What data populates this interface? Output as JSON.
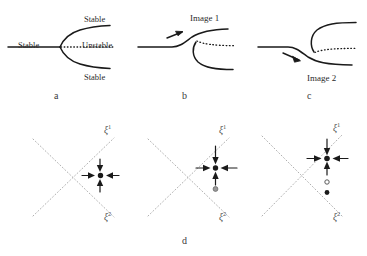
{
  "figure": {
    "type": "bifurcation-diagram-and-phase-portraits",
    "width": 367,
    "height": 256,
    "background": "#ffffff",
    "stroke_color": "#1a1a1a",
    "dotted_axis_color": "#b0b0b0",
    "open_circle_color": "#8a8a8a"
  },
  "panel_a": {
    "letter": "a",
    "labels": {
      "left_stable": "Stable",
      "upper_stable": "Stable",
      "unstable": "Unstable",
      "lower_stable": "Stable"
    }
  },
  "panel_b": {
    "letter": "b",
    "labels": {
      "image": "Image 1"
    }
  },
  "panel_c": {
    "letter": "c",
    "labels": {
      "image": "Image 2"
    }
  },
  "panel_d": {
    "letter": "d",
    "portraits": [
      {
        "name": "portrait-left",
        "axis_labels": {
          "axis1": "ξ",
          "axis1_sup": "1",
          "axis2": "ξ",
          "axis2_sup": "2"
        },
        "equilibria": [
          {
            "kind": "filled-node",
            "arrows": 4
          }
        ]
      },
      {
        "name": "portrait-middle",
        "axis_labels": {
          "axis1": "ξ",
          "axis1_sup": "1",
          "axis2": "ξ",
          "axis2_sup": "2"
        },
        "equilibria": [
          {
            "kind": "filled-node",
            "arrows": 4
          },
          {
            "kind": "gray-circle",
            "arrows": 0
          }
        ]
      },
      {
        "name": "portrait-right",
        "axis_labels": {
          "axis1": "ξ",
          "axis1_sup": "1",
          "axis2": "ξ",
          "axis2_sup": "2"
        },
        "equilibria": [
          {
            "kind": "filled-node",
            "arrows": 4
          },
          {
            "kind": "open-circle",
            "arrows": 0
          },
          {
            "kind": "filled-dot",
            "arrows": 0
          }
        ]
      }
    ]
  }
}
